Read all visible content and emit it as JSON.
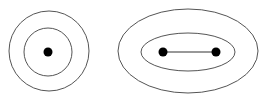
{
  "diagram": {
    "colors": {
      "background": "#ffffff",
      "stroke": "#555555",
      "point": "#000000",
      "segment": "#333333"
    },
    "left_figure": {
      "outer_circle": {
        "cx": 49,
        "cy": 51,
        "r": 40
      },
      "inner_circle": {
        "cx": 48,
        "cy": 52,
        "r": 24
      },
      "point": {
        "cx": 48,
        "cy": 52,
        "r": 4.5
      }
    },
    "right_figure": {
      "outer_ellipse": {
        "cx": 188,
        "cy": 51,
        "rx": 70,
        "ry": 42
      },
      "inner_ellipse": {
        "cx": 188,
        "cy": 52,
        "rx": 47,
        "ry": 19
      },
      "points": [
        {
          "cx": 163,
          "cy": 52,
          "r": 4.5
        },
        {
          "cx": 216,
          "cy": 52,
          "r": 4.5
        }
      ],
      "segment": {
        "x1": 163,
        "y1": 52,
        "x2": 216,
        "y2": 52
      }
    }
  }
}
